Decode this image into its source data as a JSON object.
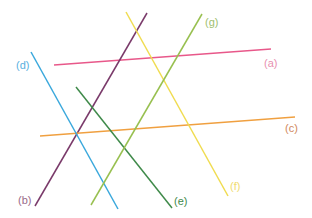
{
  "lines": [
    {
      "id": "a",
      "label": "(a)",
      "color": "#e8588a"
    },
    {
      "id": "b",
      "label": "(b)",
      "color": "#7a3a6a"
    },
    {
      "id": "c",
      "label": "(c)",
      "color": "#f0a040"
    },
    {
      "id": "d",
      "label": "(d)",
      "color": "#3aa8dc"
    },
    {
      "id": "e",
      "label": "(e)",
      "color": "#3f8a4a"
    },
    {
      "id": "f",
      "label": "(f)",
      "color": "#f0dc50"
    },
    {
      "id": "g",
      "label": "(g)",
      "color": "#98c050"
    }
  ],
  "label_colors": {
    "a": "#e890b0",
    "b": "#9a6a8a",
    "c": "#d08860",
    "d": "#58b0e0",
    "e": "#3f8a4a",
    "f": "#f0dc70",
    "g": "#a0c070"
  }
}
